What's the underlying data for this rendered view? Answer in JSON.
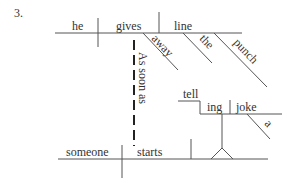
{
  "problem_number": "3.",
  "main_clause": {
    "subject": "he",
    "verb": "gives",
    "object": "line",
    "verb_modifier": "away",
    "object_modifiers": [
      "the",
      "punch"
    ]
  },
  "subordinate_clause": {
    "connector": "As soon as",
    "subject": "someone",
    "verb": "starts",
    "gerund_object": {
      "stem": "tell",
      "suffix": "ing",
      "object": "joke",
      "object_modifier": "a"
    }
  },
  "colors": {
    "line": "#555555",
    "text": "#333333",
    "background": "#ffffff"
  }
}
